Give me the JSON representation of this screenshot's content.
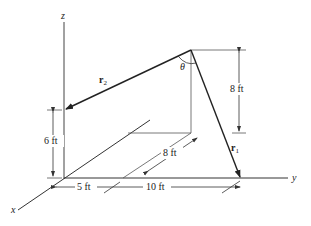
{
  "figure": {
    "type": "3D position vector diagram",
    "axes": {
      "x_label": "x",
      "y_label": "y",
      "z_label": "z"
    },
    "vectors": [
      {
        "id": "r2",
        "label": "r",
        "subscript": "2"
      },
      {
        "id": "r1",
        "label": "r",
        "subscript": "1"
      }
    ],
    "angle_label": "θ",
    "dimensions": {
      "height_left": "6 ft",
      "height_right": "8 ft",
      "x_offset": "5 ft",
      "y_offset": "10 ft",
      "diagonal": "8 ft"
    },
    "colors": {
      "line": "#222222",
      "thin_line": "#555555",
      "background": "#ffffff"
    }
  }
}
